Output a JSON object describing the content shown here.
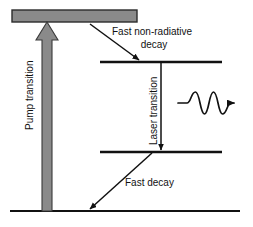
{
  "figure": {
    "kind": "energy-level-diagram",
    "background_color": "#ffffff",
    "line_color": "#111111",
    "pump_arrow_fill": "#8a8a8a",
    "pump_arrow_stroke": "#2b2b2b"
  },
  "levels": [
    {
      "id": "pump-band",
      "name": "pump-band-level",
      "style": "filled-band",
      "x1": 12,
      "x2": 137,
      "y_top": 10,
      "y_bottom": 22,
      "fill": "#8a8a8a"
    },
    {
      "id": "upper-laser-level",
      "name": "upper-laser-level",
      "style": "line",
      "x1": 100,
      "x2": 222,
      "y": 62
    },
    {
      "id": "lower-laser-level",
      "name": "lower-laser-level",
      "style": "line",
      "x1": 100,
      "x2": 222,
      "y": 152
    },
    {
      "id": "ground-level",
      "name": "ground-state-level",
      "style": "line",
      "x1": 10,
      "x2": 240,
      "y": 211
    }
  ],
  "transitions": {
    "pump": {
      "label": "Pump transition",
      "label_rotation": -90,
      "label_x": 33,
      "label_y": 130,
      "arrow_direction": "up",
      "arrow_x": 47,
      "arrow_y_start": 211,
      "arrow_y_end": 22,
      "shaft_half_width": 5,
      "head_half_width": 11,
      "head_height": 18,
      "fill": "#8a8a8a"
    },
    "fast_non_radiative_decay": {
      "label_line1": "Fast non-radiative",
      "label_line2": "decay",
      "label_x": 112,
      "label_y1": 32,
      "label_y2": 45,
      "arrow_x1": 90,
      "arrow_y1": 24,
      "arrow_x2": 140,
      "arrow_y2": 61
    },
    "laser": {
      "label": "Laser transition",
      "label_rotation": -90,
      "label_x": 155,
      "label_y": 145,
      "arrow_x": 161,
      "arrow_y1": 63,
      "arrow_y2": 151
    },
    "fast_decay": {
      "label": "Fast decay",
      "label_x": 125,
      "label_y": 183,
      "arrow_x1": 152,
      "arrow_y1": 153,
      "arrow_x2": 89,
      "arrow_y2": 210
    }
  },
  "photon": {
    "name": "emitted-photon-wave",
    "lead_in_x1": 178,
    "lead_in_x2": 186,
    "wave_center_y": 103,
    "wave_amplitude": 11,
    "cycles": 2,
    "cycle_width": 19,
    "lead_out_length": 8,
    "arrow_tip_x": 241,
    "arrowhead_size": 6
  }
}
